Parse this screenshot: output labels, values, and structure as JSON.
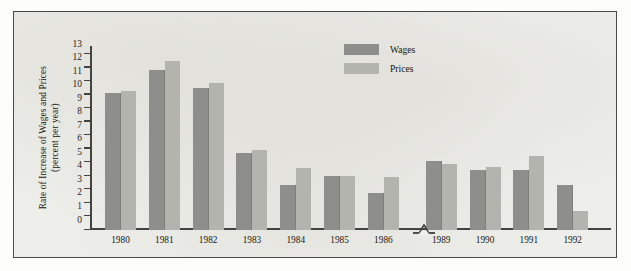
{
  "chart_data": {
    "type": "bar",
    "title": "",
    "xlabel": "",
    "ylabel": "Rate of Increase of Wages and Prices (percent per year)",
    "ylabel_line1": "Rate of Increase of Wages and Prices",
    "ylabel_line2": "(percent per year)",
    "ylim": [
      0,
      13.6
    ],
    "yticks": [
      0,
      1,
      2,
      3,
      4,
      5,
      6,
      7,
      8,
      9,
      10,
      11,
      12,
      13
    ],
    "ytick_labels": [
      "0",
      "1",
      "2",
      "3",
      "4",
      "5",
      "6",
      "7",
      "8",
      "9",
      "10",
      "11",
      "12",
      "13"
    ],
    "categories": [
      "1980",
      "1981",
      "1982",
      "1983",
      "1984",
      "1985",
      "1986",
      "1989",
      "1990",
      "1991",
      "1992"
    ],
    "axis_break_after": "1986",
    "grid": false,
    "legend_position": "top-center",
    "series": [
      {
        "name": "Wages",
        "color": "#8e8e8a",
        "values": [
          10.1,
          11.8,
          10.5,
          5.7,
          3.35,
          4.0,
          2.7,
          5.1,
          4.4,
          4.45,
          3.3
        ]
      },
      {
        "name": "Prices",
        "color": "#b4b4ae",
        "values": [
          10.3,
          12.5,
          10.9,
          5.9,
          4.6,
          4.0,
          3.9,
          4.85,
          4.65,
          5.45,
          1.4
        ]
      }
    ]
  },
  "colors": {
    "wages": "#8e8e8a",
    "prices": "#b4b4ae",
    "axis": "#43433f",
    "page": "#eeeeea",
    "border": "#4a4a48"
  }
}
